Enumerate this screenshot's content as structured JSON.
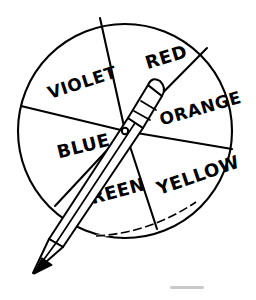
{
  "figure": {
    "type": "line-art-diagram",
    "ink_color": "#000000",
    "background_color": "#ffffff",
    "smudge_color": "#b8b8b8"
  },
  "wheel": {
    "center_x": 125,
    "center_y": 131,
    "radius": 107,
    "sector_count": 6,
    "sectors": [
      {
        "label": "RED",
        "label_x": 168,
        "label_y": 63,
        "rotation_deg": -17,
        "font_size": 18,
        "start_angle_deg": -98,
        "end_angle_deg": -40
      },
      {
        "label": "ORANGE",
        "label_x": 202,
        "label_y": 114,
        "rotation_deg": -16,
        "font_size": 17,
        "start_angle_deg": -40,
        "end_angle_deg": 10
      },
      {
        "label": "YELLOW",
        "label_x": 200,
        "label_y": 181,
        "rotation_deg": -19,
        "font_size": 18,
        "start_angle_deg": 10,
        "end_angle_deg": 72
      },
      {
        "label": "GREEN",
        "label_x": 112,
        "label_y": 199,
        "rotation_deg": -15,
        "font_size": 18,
        "start_angle_deg": 72,
        "end_angle_deg": 140
      },
      {
        "label": "BLUE",
        "label_x": 85,
        "label_y": 152,
        "rotation_deg": -14,
        "font_size": 18,
        "start_angle_deg": 140,
        "end_angle_deg": 192
      },
      {
        "label": "VIOLET",
        "label_x": 84,
        "label_y": 88,
        "rotation_deg": -18,
        "font_size": 17,
        "start_angle_deg": 192,
        "end_angle_deg": 262
      }
    ],
    "spoke_endpoints": [
      {
        "name": "spoke-red-violet",
        "x": 100,
        "y": 18
      },
      {
        "name": "spoke-red-orange",
        "x": 207,
        "y": 48
      },
      {
        "name": "spoke-orange-yellow",
        "x": 232,
        "y": 149
      },
      {
        "name": "spoke-yellow-green",
        "x": 157,
        "y": 229
      },
      {
        "name": "spoke-green-blue",
        "x": 55,
        "y": 206
      },
      {
        "name": "spoke-blue-violet",
        "x": 21,
        "y": 106
      }
    ]
  },
  "pencil": {
    "description": "Sharpened wooden pencil resting across the wheel as the spinner needle",
    "eraser_end_x": 157,
    "eraser_end_y": 84,
    "tip_x": 34,
    "tip_y": 272,
    "angle_deg": 58,
    "has_ferrule_bands": true,
    "ferrule_band_count": 2,
    "tip_is_sharpened": true,
    "graphite_filled": true
  },
  "artifacts": {
    "bottom_smudge": {
      "x": 170,
      "y": 286,
      "width": 34,
      "height": 3
    }
  }
}
